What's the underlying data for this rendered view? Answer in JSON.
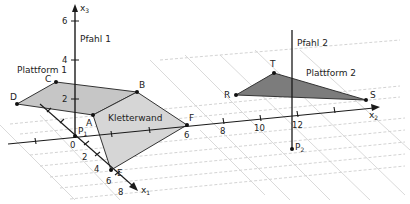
{
  "diagram": {
    "type": "3d-coordinate-system",
    "axes": {
      "x1": {
        "label": "x",
        "sub": "1",
        "ticks": [
          "2",
          "4",
          "6",
          "8"
        ]
      },
      "x2": {
        "label": "x",
        "sub": "2",
        "ticks": [
          "6",
          "8",
          "10",
          "12"
        ]
      },
      "x3": {
        "label": "x",
        "sub": "3",
        "ticks": [
          "2",
          "4",
          "6"
        ]
      },
      "origin": "0"
    },
    "labels": {
      "pfahl1": "Pfahl 1",
      "pfahl2": "Pfahl 2",
      "plattform1": "Plattform 1",
      "plattform2": "Plattform 2",
      "kletterwand": "Kletterwand"
    },
    "points": {
      "A": "A",
      "B": "B",
      "C": "C",
      "D": "D",
      "E": "E",
      "F": "F",
      "R": "R",
      "S": "S",
      "T": "T",
      "P1": {
        "label": "P",
        "sub": "1"
      },
      "P2": {
        "label": "P",
        "sub": "2"
      }
    },
    "colors": {
      "plattform1_fill": "#c8c8c8",
      "kletterwand_fill": "#d4d4d4",
      "plattform2_fill": "#7a7a7a",
      "line": "#1a1a1a",
      "grid": "#c4c4c4"
    }
  }
}
